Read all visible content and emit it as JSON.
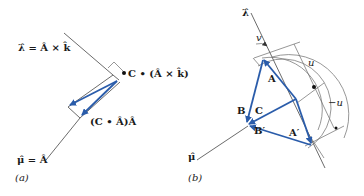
{
  "figure": {
    "panel_a": {
      "caption": "(a)",
      "lambda_label": "λ̂ = Â × k̂",
      "mu_label": "μ̂ = Â",
      "cross_component_label": "C • (Â × k̂)",
      "dot_component_label": "(C • Â)Â"
    },
    "panel_b": {
      "caption": "(b)",
      "lambda_label": "λ̂",
      "mu_label": "μ̂",
      "vector_A": "A",
      "vector_B": "B",
      "vector_C": "C",
      "vector_A_prime": "A′",
      "vector_B_prime": "B′",
      "small_offset_label": "v",
      "u_label": "u",
      "neg_u_label": "−u"
    },
    "colors": {
      "vector": "#2a5caa",
      "axis": "#5a5a5a",
      "text": "#1a1a1a"
    }
  }
}
